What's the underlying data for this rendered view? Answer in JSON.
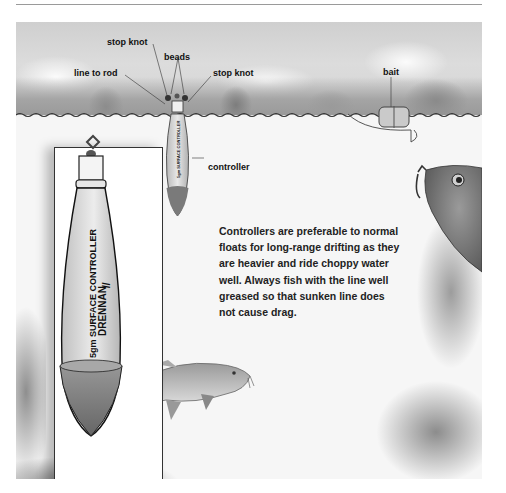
{
  "labels": {
    "stop_knot_top": "stop knot",
    "beads": "beads",
    "line_to_rod": "line to rod",
    "stop_knot_right": "stop knot",
    "bait": "bait",
    "controller": "controller"
  },
  "caption": {
    "lines": [
      "Controllers are preferable to normal",
      "floats for long-range drifting as they",
      "are heavier and ride choppy water",
      "well. Always fish with the line well",
      "greased so that sunken line does",
      "not cause drag."
    ]
  },
  "inset_float": {
    "product_line": "5gm SURFACE CONTROLLER",
    "brand": "DRENNAN",
    "brand_mark": "//"
  },
  "colors": {
    "palette": "grayscale",
    "ink": "#111111",
    "float_body": "#d8d8d8",
    "float_ballast": "#7a7a7a"
  }
}
